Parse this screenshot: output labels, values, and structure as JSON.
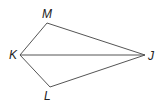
{
  "diagram": {
    "type": "kite",
    "vertices": [
      {
        "name": "M",
        "x": 47,
        "y": 23,
        "label_x": 42,
        "label_y": 18
      },
      {
        "name": "K",
        "x": 20,
        "y": 55,
        "label_x": 9,
        "label_y": 59
      },
      {
        "name": "L",
        "x": 50,
        "y": 87,
        "label_x": 44,
        "label_y": 100
      },
      {
        "name": "J",
        "x": 145,
        "y": 55,
        "label_x": 148,
        "label_y": 60
      }
    ],
    "segments": [
      [
        "K",
        "M"
      ],
      [
        "M",
        "J"
      ],
      [
        "J",
        "L"
      ],
      [
        "L",
        "K"
      ],
      [
        "K",
        "J"
      ]
    ],
    "stroke_color": "#555555",
    "label_color": "#222222"
  }
}
